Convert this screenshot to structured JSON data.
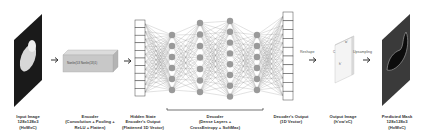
{
  "stages": {
    "input": {
      "title": "Input Image",
      "line2": "128x128x3",
      "line3": "(HxWxC)"
    },
    "encoder": {
      "title": "Encoder",
      "line2": "(Convolution + Pooling +",
      "line3": "ReLU + Flatten)",
      "box_text": "Nonlin(53 Nonlin(13)1)"
    },
    "hidden": {
      "title": "Hidden State",
      "line2": "Encoder's Output",
      "line3": "(Flattened 1D Vector)"
    },
    "decoder": {
      "title": "Decoder",
      "line2": "(Dense Layers +",
      "line3": "CrossEntropy + SoftMax)"
    },
    "decoder_output": {
      "title": "Decoder's Output",
      "line2": "(1D Vector)"
    },
    "output_image": {
      "title": "Output Image",
      "line2": "(h'xw'xC)",
      "dim_w": "w'",
      "dim_h": "h'",
      "dim_c": "C"
    },
    "predicted": {
      "title": "Predicted Mask",
      "line2": "128x128x3",
      "line3": "(HxWxC)"
    }
  },
  "arrows": {
    "reshape": "Reshape",
    "upsampling": "Upsampling"
  },
  "colors": {
    "node": "#9a9a9a",
    "edge": "#777777",
    "box": "#c8c8c8",
    "dark": "#1a1a1a",
    "mask_bg": "#3a3a3a"
  }
}
